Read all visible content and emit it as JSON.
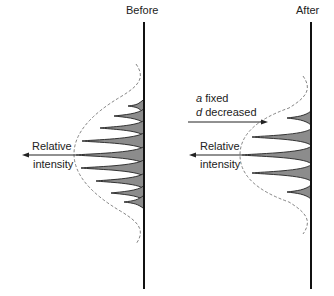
{
  "panels": [
    {
      "title": "Before",
      "axis_label_line1": "Relative",
      "axis_label_line2": "intensity",
      "baseline_x": 144,
      "peaks": [
        {
          "y": 106,
          "tip_x": 128
        },
        {
          "y": 116,
          "tip_x": 114
        },
        {
          "y": 128,
          "tip_x": 100
        },
        {
          "y": 141,
          "tip_x": 82
        },
        {
          "y": 155,
          "tip_x": 76
        },
        {
          "y": 168,
          "tip_x": 81
        },
        {
          "y": 181,
          "tip_x": 96
        },
        {
          "y": 193,
          "tip_x": 111
        },
        {
          "y": 202,
          "tip_x": 124
        }
      ]
    },
    {
      "title": "After",
      "axis_label_line1": "Relative",
      "axis_label_line2": "intensity",
      "baseline_x": 311,
      "peaks": [
        {
          "y": 118,
          "tip_x": 287
        },
        {
          "y": 137,
          "tip_x": 252
        },
        {
          "y": 155,
          "tip_x": 242
        },
        {
          "y": 173,
          "tip_x": 252
        },
        {
          "y": 192,
          "tip_x": 287
        }
      ]
    }
  ],
  "annotation": {
    "var_a": "a",
    "line1_rest": " fixed",
    "var_d": "d",
    "line2_rest": " decreased"
  },
  "colors": {
    "line": "#111111",
    "peak_fill": "#8c8c8c",
    "envelope": "#666666"
  }
}
